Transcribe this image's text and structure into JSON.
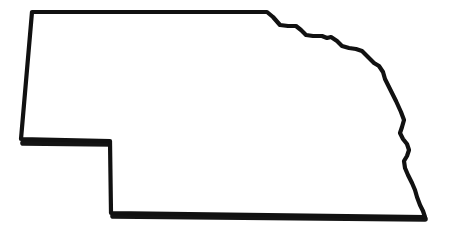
{
  "image": {
    "title": "Nebraska state outline map",
    "subject": "Nebraska",
    "kind": "outline-map",
    "background_color": "#ffffff",
    "outline_color": "#111111",
    "fill_color": "#ffffff",
    "width": 449,
    "height": 232,
    "caption": "",
    "labels": []
  },
  "map": {
    "region_name": "Nebraska",
    "stroke_width": 4.2,
    "outline_color": "#111111",
    "fill_color": "#ffffff",
    "shadow_color": "#141414",
    "viewbox": "0 0 449 232",
    "outline_path": "M 32 12 L 267 12 L 273 17 L 280 25 L 288 26 L 296 26 L 301 30 L 306 35 L 313 36 L 322 36 L 327 38 L 331 37 L 337 41 L 342 46 L 349 48 L 356 49 L 362 51 L 368 57 L 374 63 L 379 66 L 383 72 L 385 79 L 391 91 L 396 101 L 401 112 L 404 120 L 402 127 L 400 133 L 403 139 L 407 144 L 409 150 L 407 156 L 404 161 L 405 168 L 408 175 L 412 183 L 415 190 L 417 197 L 420 205 L 423 211 L 425 217 L 111 213 L 110 141 L 21 139 Z",
    "shadow_path_bottom": "M 113 216 L 425 219",
    "shadow_path_notch": "M 23 143 L 112 144",
    "features": [
      {
        "name": "north-border",
        "type": "straight-line",
        "description": "South Dakota border, straight east-west segment"
      },
      {
        "name": "west-border",
        "type": "straight-line",
        "description": "Wyoming border, near vertical"
      },
      {
        "name": "panhandle-notch",
        "type": "step",
        "description": "Colorado border step notch at southwest"
      },
      {
        "name": "south-border",
        "type": "straight-line",
        "description": "Kansas border, straight east-west segment"
      },
      {
        "name": "east-border",
        "type": "river-boundary",
        "description": "Missouri River boundary, irregular wavy line"
      },
      {
        "name": "northeast-steps",
        "type": "river-boundary",
        "description": "Missouri River stepped boundary with South Dakota"
      }
    ]
  }
}
